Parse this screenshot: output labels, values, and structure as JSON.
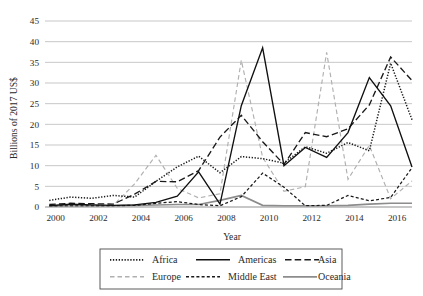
{
  "chart_data": {
    "type": "line",
    "title": "",
    "xlabel": "Year",
    "ylabel": "Billions of 2017 US$",
    "xlim": [
      1999.5,
      2016.7
    ],
    "ylim": [
      0,
      45
    ],
    "ytick_step": 5,
    "yticks": [
      0,
      5,
      10,
      15,
      20,
      25,
      30,
      35,
      40,
      45
    ],
    "xticks": [
      2000,
      2002,
      2004,
      2006,
      2008,
      2010,
      2012,
      2014,
      2016
    ],
    "grid": "horizontal",
    "legend_position": "below-axis",
    "x": [
      1999.7,
      2000.7,
      2001.7,
      2002.7,
      2003.7,
      2004.7,
      2005.7,
      2006.7,
      2007.7,
      2008.7,
      2009.7,
      2010.7,
      2011.7,
      2012.7,
      2013.7,
      2014.7,
      2015.7,
      2016.7
    ],
    "series": [
      {
        "name": "Africa",
        "style": "dotted",
        "color": "#1a1a1a",
        "values": [
          1.6,
          2.4,
          2.1,
          2.8,
          2.4,
          6.2,
          9.7,
          12.3,
          8.3,
          12.2,
          11.7,
          10.6,
          14.6,
          13.0,
          15.6,
          13.6,
          34.8,
          21.1
        ]
      },
      {
        "name": "Americas",
        "style": "solid",
        "color": "#101010",
        "values": [
          0.3,
          0.7,
          0.5,
          0.4,
          0.5,
          1.1,
          2.6,
          8.5,
          0.7,
          24.5,
          38.5,
          10.0,
          14.4,
          12.0,
          18.0,
          31.3,
          24.5,
          9.7
        ]
      },
      {
        "name": "Asia",
        "style": "long-dash",
        "color": "#1a1a1a",
        "values": [
          0.6,
          0.9,
          0.8,
          0.7,
          3.1,
          6.2,
          6.1,
          8.8,
          16.9,
          22.2,
          15.8,
          10.3,
          18.0,
          17.0,
          18.9,
          24.7,
          36.3,
          30.6
        ]
      },
      {
        "name": "Europe",
        "style": "gray-dash",
        "color": "#b0b0b0",
        "values": [
          0.4,
          0.6,
          0.5,
          0.4,
          5.6,
          12.5,
          4.5,
          2.2,
          3.2,
          35.5,
          12.0,
          3.8,
          4.9,
          37.4,
          6.7,
          14.9,
          2.0,
          6.3
        ]
      },
      {
        "name": "Middle East",
        "style": "short-dash",
        "color": "#1a1a1a",
        "values": [
          0.2,
          0.3,
          0.3,
          0.3,
          0.4,
          0.9,
          1.3,
          0.6,
          0.3,
          2.5,
          8.2,
          4.8,
          0.3,
          0.4,
          2.8,
          1.5,
          2.3,
          9.5
        ]
      },
      {
        "name": "Oceania",
        "style": "gray-solid",
        "color": "#8c8c8c",
        "values": [
          0.2,
          0.3,
          0.3,
          0.3,
          0.4,
          0.5,
          0.6,
          0.6,
          1.6,
          2.8,
          0.4,
          0.3,
          0.3,
          0.3,
          0.4,
          0.7,
          0.9,
          0.9
        ]
      }
    ]
  },
  "legend": {
    "entries": [
      {
        "label": "Africa"
      },
      {
        "label": "Americas"
      },
      {
        "label": "Asia"
      },
      {
        "label": "Europe"
      },
      {
        "label": "Middle East"
      },
      {
        "label": "Oceania"
      }
    ]
  },
  "axes": {
    "y_title": "Billions of 2017 US$",
    "x_title": "Year",
    "y_tick_labels": [
      "45",
      "40",
      "35",
      "30",
      "25",
      "20",
      "15",
      "10",
      "5",
      "0"
    ],
    "x_tick_labels": [
      "2000",
      "2002",
      "2004",
      "2006",
      "2008",
      "2010",
      "2012",
      "2014",
      "2016"
    ]
  }
}
